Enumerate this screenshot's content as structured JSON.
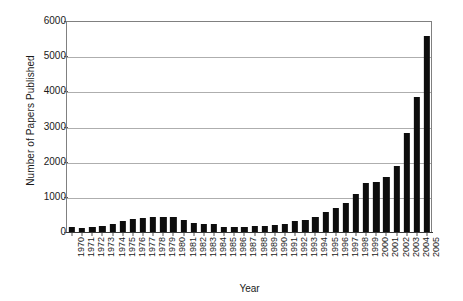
{
  "chart_data": {
    "type": "bar",
    "title": "",
    "xlabel": "Year",
    "ylabel": "Number of Papers Published",
    "ylim": [
      0,
      6000
    ],
    "ytick_values": [
      0,
      1000,
      2000,
      3000,
      4000,
      5000,
      6000
    ],
    "ytick_labels": [
      "0",
      "1000",
      "2000",
      "3000",
      "4000",
      "5000",
      "6000"
    ],
    "grid": true,
    "legend": "none",
    "bar_color": "#0d0d0d",
    "categories": [
      "1970",
      "1971",
      "1972",
      "1973",
      "1974",
      "1975",
      "1976",
      "1977",
      "1978",
      "1979",
      "1980",
      "1981",
      "1982",
      "1983",
      "1984",
      "1985",
      "1986",
      "1987",
      "1988",
      "1989",
      "1990",
      "1991",
      "1992",
      "1993",
      "1994",
      "1995",
      "1996",
      "1997",
      "1998",
      "1999",
      "2000",
      "2001",
      "2002",
      "2003",
      "2004",
      "2005"
    ],
    "values": [
      130,
      120,
      150,
      175,
      215,
      300,
      370,
      410,
      430,
      420,
      440,
      330,
      250,
      225,
      215,
      135,
      145,
      150,
      160,
      175,
      200,
      235,
      300,
      330,
      430,
      560,
      680,
      830,
      1080,
      1400,
      1430,
      1560,
      1870,
      2810,
      3830,
      5560
    ]
  }
}
